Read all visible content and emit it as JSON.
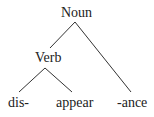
{
  "tree": {
    "root": "Noun",
    "nodes": {
      "noun": "Noun",
      "verb": "Verb",
      "dis": "dis-",
      "appear": "appear",
      "ance": "-ance"
    },
    "edges": [
      [
        "Noun",
        "Verb"
      ],
      [
        "Noun",
        "-ance"
      ],
      [
        "Verb",
        "dis-"
      ],
      [
        "Verb",
        "appear"
      ]
    ]
  }
}
